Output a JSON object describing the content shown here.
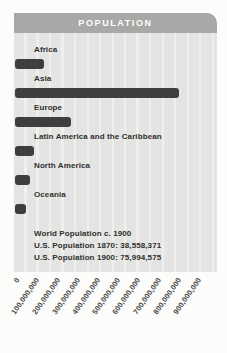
{
  "chart_data": {
    "type": "bar",
    "orientation": "horizontal",
    "title": "POPULATION",
    "categories": [
      "Africa",
      "Asia",
      "Europe",
      "Latin America and the Caribbean",
      "North America",
      "Oceania"
    ],
    "values": [
      145000000,
      810000000,
      275000000,
      92000000,
      73000000,
      55000000
    ],
    "xlabel": "",
    "ylabel": "",
    "xlim": [
      0,
      1000000000
    ],
    "tick_step": 100000000,
    "xticks": [
      "0",
      "100,000,000",
      "200,000,000",
      "300,000,000",
      "400,000,000",
      "500,000,000",
      "600,000,000",
      "700,000,000",
      "800,000,000",
      "900,000,000"
    ],
    "grid": false,
    "legend": "none",
    "notes": [
      "World Population c. 1900",
      "U.S. Population 1870: 38,558,371",
      "U.S. Population 1900: 75,994,575"
    ],
    "colors": {
      "bar": "#3e3e3c",
      "panel_bg": "#e4e4e2",
      "panel_stripe": "#efefed",
      "header_bg": "#a8a8a6",
      "header_text": "#ffffff",
      "label_text": "#2f2f2e",
      "axis_text": "#4b4b49",
      "page_bg": "#fcfcfb"
    }
  }
}
